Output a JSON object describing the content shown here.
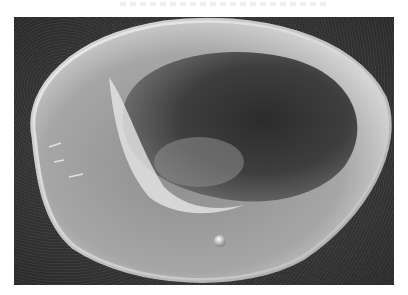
{
  "image": {
    "subject": "Scanning electron micrograph of a red blood cell (erythrocyte)",
    "description": "Biconcave disc-shaped cell viewed at an oblique angle with a bright raised rim, a darker central depression with textured surface, and a small spherical particle near the lower rim",
    "style": "grayscale",
    "colors": {
      "background": "#3a3a3a",
      "cell_surface": "#9a9a9a",
      "rim_highlight": "#e8e8e8",
      "concavity": "#3c3c3c",
      "page": "#ffffff"
    }
  }
}
